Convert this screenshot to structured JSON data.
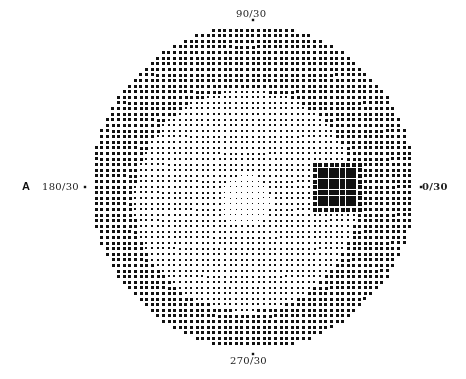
{
  "panel_label": "A",
  "axes": {
    "top": "90/30",
    "bottom": "270/30",
    "left": "180/30",
    "right": "0/30"
  },
  "chart_data": {
    "type": "heatmap",
    "title": "",
    "axis_labels": {
      "top": "90/30",
      "bottom": "270/30",
      "left": "180/30",
      "right": "0/30"
    },
    "field_extent_deg": 30,
    "grid": {
      "center_px": [
        253,
        187
      ],
      "radius_px": 162,
      "spacing_px": 5.6
    },
    "pattern": {
      "center_density": "light",
      "periphery_density": "dark",
      "light_region_center_px": [
        245,
        200
      ],
      "blind_spot": {
        "meridian_deg": 0,
        "eccentricity_deg": 15.5,
        "center_px": [
          338,
          187
        ],
        "width_px": 36,
        "height_px": 36,
        "density": "black"
      }
    },
    "colors": {
      "dot": "#111111",
      "background": "#ffffff"
    }
  }
}
